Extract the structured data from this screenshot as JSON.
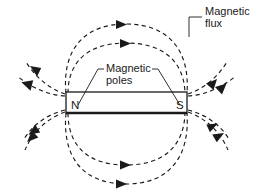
{
  "figure": {
    "background_color": "#ffffff",
    "ink_color": "#1a1a1a"
  },
  "annotations": {
    "flux": {
      "line1": "Magnetic",
      "line2": "flux",
      "full": "Magnetic flux"
    },
    "poles": {
      "line1": "Magnetic",
      "line2": "poles",
      "full": "Magnetic poles"
    }
  },
  "magnet": {
    "north_label": "N",
    "south_label": "S",
    "x": 66,
    "y": 92,
    "width": 121,
    "height": 21
  },
  "field": {
    "style": "dashed",
    "arrow_direction": "north-to-south",
    "loop_count": 2,
    "pole_spray_count": 4
  }
}
